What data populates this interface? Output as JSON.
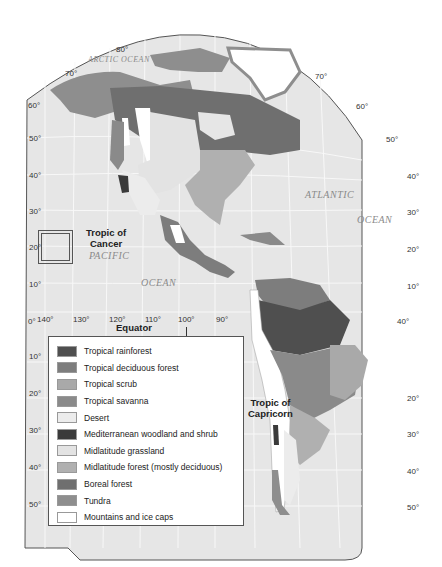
{
  "map": {
    "title": "Biomes of the Americas",
    "oceans": [
      {
        "id": "arctic",
        "label": "ARCTIC OCEAN"
      },
      {
        "id": "atlantic1",
        "label": "ATLANTIC"
      },
      {
        "id": "atlantic2",
        "label": "OCEAN"
      },
      {
        "id": "pacific1",
        "label": "PACIFIC"
      },
      {
        "id": "pacific2",
        "label": "OCEAN"
      }
    ],
    "annotations": {
      "tropic_cancer": "Tropic of\nCancer",
      "tropic_capricorn": "Tropic of\nCapricorn",
      "equator": "Equator"
    },
    "latitude_labels_left": [
      "60°",
      "50°",
      "40°",
      "30°",
      "20°",
      "10°",
      "0°",
      "10°",
      "20°",
      "30°",
      "40°",
      "50°"
    ],
    "latitude_labels_right": [
      "50°",
      "40°",
      "30°",
      "20°",
      "10°",
      "40°",
      "20°",
      "30°",
      "40°",
      "50°"
    ],
    "top_labels": [
      "70°",
      "80°",
      "70°",
      "60°"
    ],
    "longitude_labels": [
      "140°",
      "130°",
      "120°",
      "110°",
      "100°",
      "90°"
    ],
    "colors": {
      "ocean": "#e6e6e6",
      "grid": "#f7f7f7",
      "border": "#555555",
      "tropical_rainforest": "#4f4f4f",
      "tropical_deciduous": "#7d7d7d",
      "tropical_scrub": "#a9a9a9",
      "tropical_savanna": "#8a8a8a",
      "desert": "#ececec",
      "mediterranean": "#3a3a3a",
      "grassland": "#e0e0e0",
      "midlat_forest": "#b0b0b0",
      "boreal": "#6f6f6f",
      "tundra": "#8e8e8e",
      "mountains": "#ffffff"
    }
  },
  "legend": {
    "items": [
      {
        "label": "Tropical rainforest",
        "color": "#4f4f4f"
      },
      {
        "label": "Tropical deciduous forest",
        "color": "#7d7d7d"
      },
      {
        "label": "Tropical scrub",
        "color": "#a9a9a9"
      },
      {
        "label": "Tropical savanna",
        "color": "#8a8a8a"
      },
      {
        "label": "Desert",
        "color": "#ececec"
      },
      {
        "label": "Mediterranean woodland and shrub",
        "color": "#3a3a3a"
      },
      {
        "label": "Midlatitude grassland",
        "color": "#e3e3e3"
      },
      {
        "label": "Midlatitude forest (mostly deciduous)",
        "color": "#b0b0b0"
      },
      {
        "label": "Boreal forest",
        "color": "#6f6f6f"
      },
      {
        "label": "Tundra",
        "color": "#8e8e8e"
      },
      {
        "label": "Mountains and ice caps",
        "color": "#ffffff"
      }
    ]
  }
}
